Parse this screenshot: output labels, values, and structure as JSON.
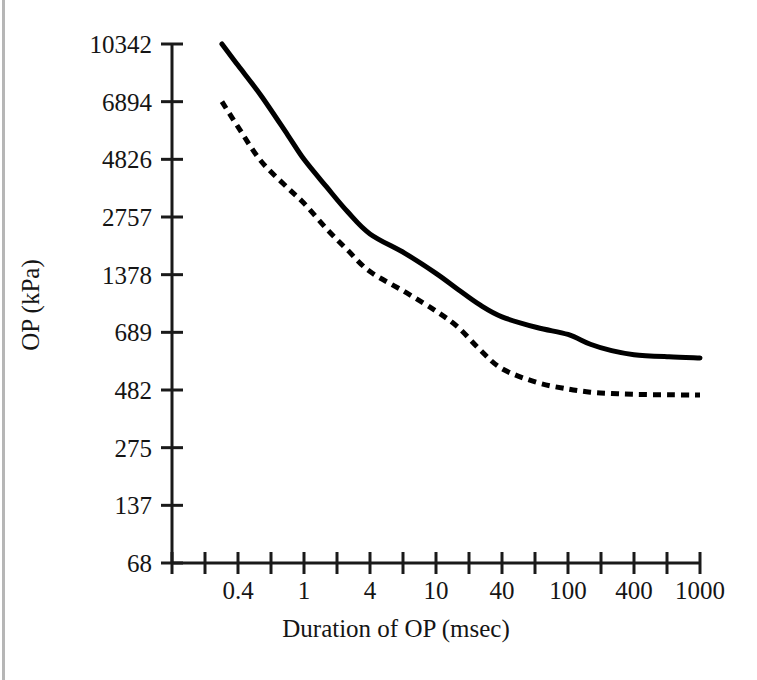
{
  "figure": {
    "caption_present": false,
    "background_color": "#ffffff",
    "edge_color": "#b6b6b6"
  },
  "chart_data": {
    "type": "line",
    "title": "",
    "subtitle": "",
    "xlabel": "Duration of OP (msec)",
    "ylabel": "OP (kPa)",
    "x_scale": "log",
    "y_scale": "log",
    "grid": false,
    "legend": null,
    "legend_position": "none",
    "x_tick_labels": [
      "0.4",
      "1",
      "4",
      "10",
      "40",
      "100",
      "400",
      "1000"
    ],
    "x_tick_values": [
      0.4,
      1,
      4,
      10,
      40,
      100,
      400,
      1000
    ],
    "x_minor_ticks_between": 1,
    "xlim": [
      0.2,
      1600
    ],
    "y_tick_labels": [
      "68",
      "137",
      "275",
      "482",
      "689",
      "1378",
      "2757",
      "4826",
      "6894",
      "10342"
    ],
    "y_tick_values": [
      68,
      137,
      275,
      482,
      689,
      1378,
      2757,
      4826,
      6894,
      10342
    ],
    "ylim": [
      68,
      10342
    ],
    "series": [
      {
        "name": "upper-curve",
        "style": "solid",
        "color": "#000000",
        "x": [
          0.32,
          0.4,
          0.55,
          0.8,
          1,
          1.6,
          2.5,
          4,
          6.5,
          10,
          16,
          25,
          40,
          65,
          100,
          160,
          250,
          400,
          650,
          1000
        ],
        "y": [
          10342,
          8900,
          7200,
          5600,
          4826,
          3700,
          2900,
          2250,
          1780,
          1400,
          1150,
          960,
          830,
          730,
          680,
          640,
          615,
          600,
          592,
          588
        ]
      },
      {
        "name": "lower-curve",
        "style": "dashed",
        "color": "#000000",
        "x": [
          0.32,
          0.4,
          0.55,
          0.8,
          1,
          1.6,
          2.5,
          4,
          6.5,
          10,
          16,
          25,
          40,
          65,
          100,
          160,
          250,
          400,
          650,
          1000
        ],
        "y": [
          6894,
          5900,
          4750,
          3650,
          3150,
          2400,
          1850,
          1430,
          1120,
          890,
          730,
          620,
          550,
          505,
          485,
          472,
          466,
          462,
          460,
          459
        ]
      }
    ],
    "annotations": []
  },
  "geometry": {
    "plot_left": 172,
    "plot_right": 700,
    "plot_top": 44,
    "plot_bottom": 563,
    "data_start_x": 215,
    "data_end_x": 693
  }
}
